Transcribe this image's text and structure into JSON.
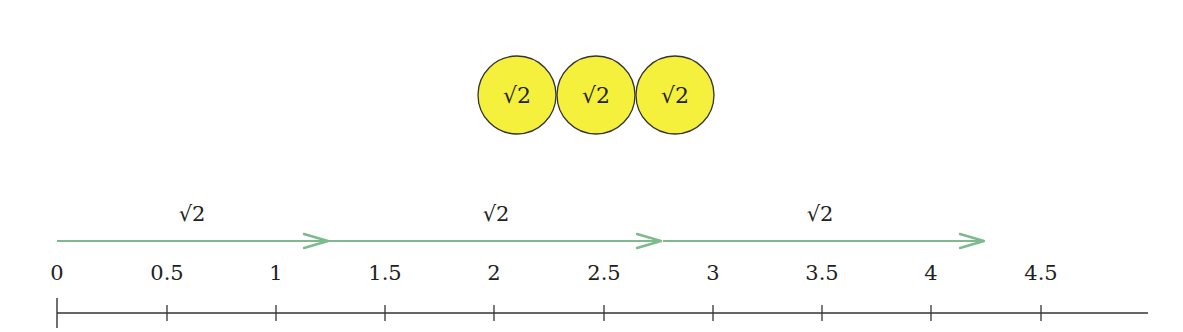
{
  "coins": {
    "fill": "#f5f03c",
    "stroke": "#333333",
    "items": [
      {
        "label": "√2",
        "cx": 517,
        "cy": 95,
        "r": 39
      },
      {
        "label": "√2",
        "cx": 596,
        "cy": 95,
        "r": 39
      },
      {
        "label": "√2",
        "cx": 675,
        "cy": 95,
        "r": 39
      }
    ]
  },
  "arrows": {
    "color": "#7dba8e",
    "y": 241,
    "items": [
      {
        "label": "√2",
        "x1": 57,
        "x2": 328,
        "label_x": 192
      },
      {
        "label": "√2",
        "x1": 298,
        "x2": 661,
        "label_x": 496
      },
      {
        "label": "√2",
        "x1": 663,
        "x2": 984,
        "label_x": 820
      }
    ]
  },
  "number_line": {
    "axis_y": 313,
    "x_start": 57,
    "x_end": 1148,
    "color": "#333333",
    "ticks": [
      {
        "label": "0",
        "x": 57
      },
      {
        "label": "0.5",
        "x": 167
      },
      {
        "label": "1",
        "x": 276
      },
      {
        "label": "1.5",
        "x": 385
      },
      {
        "label": "2",
        "x": 494
      },
      {
        "label": "2.5",
        "x": 604
      },
      {
        "label": "3",
        "x": 713
      },
      {
        "label": "3.5",
        "x": 822
      },
      {
        "label": "4",
        "x": 931
      },
      {
        "label": "4.5",
        "x": 1041
      }
    ]
  }
}
